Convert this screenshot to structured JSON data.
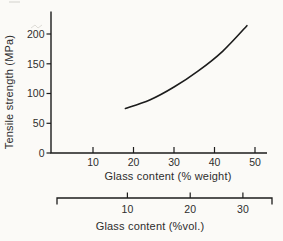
{
  "figure": {
    "background_color": "#fbfaf7",
    "ink_color": "#1c1c1c",
    "text_color": "#2d2d2d"
  },
  "chart_data": {
    "type": "line",
    "title": "",
    "xlabel": "Glass content (% weight)",
    "ylabel": "Tensile strength (MPa)",
    "xlim": [
      0,
      53.5
    ],
    "ylim": [
      0,
      231
    ],
    "x_ticks": [
      10,
      20,
      30,
      40,
      50
    ],
    "y_ticks": [
      0,
      50,
      100,
      150,
      200
    ],
    "grid": false,
    "legend": "none",
    "series": [
      {
        "name": "tensile strength vs glass content",
        "color": "#1c1c1c",
        "points": [
          [
            18,
            75
          ],
          [
            24,
            89
          ],
          [
            30,
            111
          ],
          [
            36,
            138
          ],
          [
            42,
            171
          ],
          [
            48,
            214
          ]
        ]
      }
    ],
    "secondary_x_axis": {
      "label": "Glass content (%vol.)",
      "ticks": [
        {
          "label": "10",
          "wt_equivalent": 18.5
        },
        {
          "label": "20",
          "wt_equivalent": 34
        },
        {
          "label": "30",
          "wt_equivalent": 47
        }
      ]
    }
  }
}
